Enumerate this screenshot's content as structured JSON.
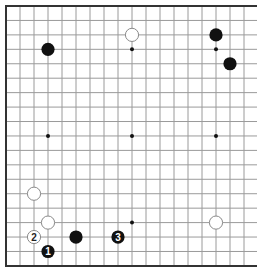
{
  "board": {
    "size": 19,
    "origin_x": 6,
    "origin_y": 6,
    "spacing_x": 14,
    "spacing_y": 14.44,
    "edges": {
      "top": true,
      "left": true,
      "bottom": true,
      "right": false
    },
    "colors": {
      "background": "#ffffff",
      "grid": "#9a9a9a",
      "border": "#333333",
      "black_stone": "#111111",
      "white_stone_fill": "#ffffff",
      "white_stone_stroke": "#8a8a8a",
      "star": "#111111"
    },
    "star_points": [
      [
        3,
        3
      ],
      [
        9,
        3
      ],
      [
        15,
        3
      ],
      [
        3,
        9
      ],
      [
        9,
        9
      ],
      [
        15,
        9
      ],
      [
        3,
        15
      ],
      [
        9,
        15
      ],
      [
        15,
        15
      ]
    ],
    "stones": [
      {
        "color": "black",
        "col": 3,
        "row": 3,
        "label": ""
      },
      {
        "color": "white",
        "col": 9,
        "row": 2,
        "label": ""
      },
      {
        "color": "black",
        "col": 15,
        "row": 2,
        "label": ""
      },
      {
        "color": "black",
        "col": 16,
        "row": 4,
        "label": ""
      },
      {
        "color": "white",
        "col": 2,
        "row": 13,
        "label": ""
      },
      {
        "color": "white",
        "col": 3,
        "row": 15,
        "label": ""
      },
      {
        "color": "white",
        "col": 2,
        "row": 16,
        "label": "2"
      },
      {
        "color": "black",
        "col": 3,
        "row": 17,
        "label": "1"
      },
      {
        "color": "black",
        "col": 5,
        "row": 16,
        "label": ""
      },
      {
        "color": "black",
        "col": 8,
        "row": 16,
        "label": "3"
      },
      {
        "color": "white",
        "col": 15,
        "row": 15,
        "label": ""
      }
    ]
  }
}
